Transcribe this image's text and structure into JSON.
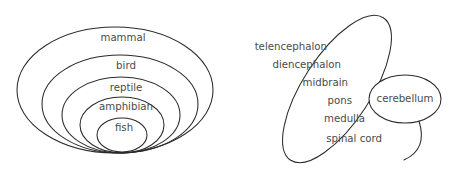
{
  "figure": {
    "title": "",
    "background_color": "#ffffff",
    "stroke_color": "#2b2b2b",
    "text_color": "#4a4a4a"
  },
  "left_diagram": {
    "name": "nested-vertebrate-classes",
    "type": "nested-ellipses",
    "description": "Concentric nested ellipses tangent at a common bottom point",
    "levels": [
      {
        "label": "mammal",
        "order": 1,
        "cx": 115,
        "cy": 90,
        "rx": 98,
        "ry": 63,
        "label_x": 123,
        "label_y": 38
      },
      {
        "label": "bird",
        "order": 2,
        "cx": 120,
        "cy": 104,
        "rx": 78,
        "ry": 49,
        "label_x": 126,
        "label_y": 66
      },
      {
        "label": "reptile",
        "order": 3,
        "cx": 121,
        "cy": 115,
        "rx": 59,
        "ry": 38,
        "label_x": 126,
        "label_y": 88
      },
      {
        "label": "amphibian",
        "order": 4,
        "cx": 122,
        "cy": 125,
        "rx": 42,
        "ry": 28,
        "label_x": 126,
        "label_y": 107
      },
      {
        "label": "fish",
        "order": 5,
        "cx": 122,
        "cy": 135,
        "rx": 25,
        "ry": 17,
        "label_x": 124,
        "label_y": 128
      }
    ]
  },
  "right_diagram": {
    "name": "brain-regions",
    "type": "tilted-ellipse-with-lobe",
    "description": "A tilted elongated ellipse listing brain divisions, overlapping a small ellipse labelled cerebellum",
    "main_ellipse": {
      "name": "brainstem-forebrain-ellipse",
      "cx": 337,
      "cy": 89,
      "rx": 34,
      "ry": 85,
      "rotation_deg": 33
    },
    "lobe_ellipse": {
      "name": "cerebellum-ellipse",
      "label": "cerebellum",
      "cx": 405,
      "cy": 99,
      "rx": 36,
      "ry": 24,
      "label_x": 405,
      "label_y": 99
    },
    "labels": [
      {
        "label": "telencephalon",
        "x": 327,
        "y": 47
      },
      {
        "label": "diencephalon",
        "x": 341,
        "y": 65
      },
      {
        "label": "midbrain",
        "x": 348,
        "y": 83
      },
      {
        "label": "pons",
        "x": 352,
        "y": 101
      },
      {
        "label": "medulla",
        "x": 365,
        "y": 119
      },
      {
        "label": "spinal cord",
        "x": 382,
        "y": 139
      }
    ]
  }
}
